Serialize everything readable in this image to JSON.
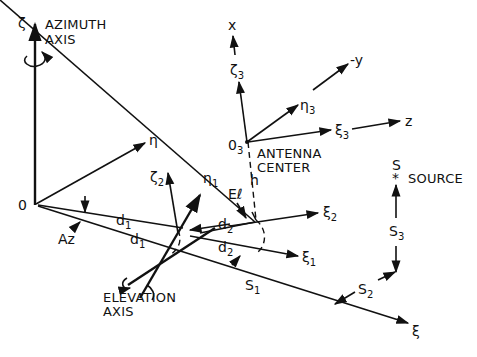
{
  "figure": {
    "type": "coordinate-system diagram"
  },
  "labels": {
    "azimuth_axis_symbol": "ζ",
    "azimuth_axis_line1": "AZIMUTH",
    "azimuth_axis_line2": "AXIS",
    "origin": "0",
    "eta": "η",
    "xi": "ξ",
    "az": "Az",
    "d1_upper": "d",
    "d1_upper_sub": "1",
    "d1_lower": "d",
    "d1_lower_sub": "1",
    "zeta2": "ζ",
    "zeta2_sub": "2",
    "eta1": "η",
    "eta1_sub": "1",
    "el": "Eℓ",
    "d2_upper": "d",
    "d2_upper_sub": "2",
    "d2_lower": "d",
    "d2_lower_sub": "2",
    "xi2": "ξ",
    "xi2_sub": "2",
    "xi1": "ξ",
    "xi1_sub": "1",
    "h": "h",
    "elevation_axis_line1": "ELEVATION",
    "elevation_axis_line2": "AXIS",
    "s1": "S",
    "s1_sub": "1",
    "s2": "S",
    "s2_sub": "2",
    "s3": "S",
    "s3_sub": "3",
    "source_symbol": "S",
    "source_star": "*",
    "source_label": "SOURCE",
    "o3": "0",
    "o3_sub": "3",
    "antenna_center_line1": "ANTENNA",
    "antenna_center_line2": "CENTER",
    "x": "x",
    "zeta3": "ζ",
    "zeta3_sub": "3",
    "minus_y": "-y",
    "eta3": "η",
    "eta3_sub": "3",
    "xi3": "ξ",
    "xi3_sub": "3",
    "z": "z"
  }
}
